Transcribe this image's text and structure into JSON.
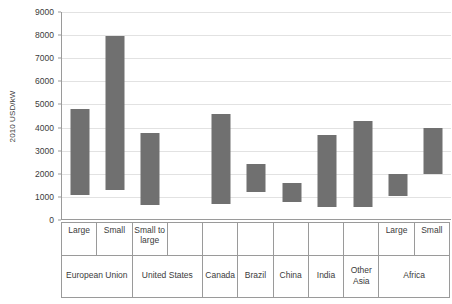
{
  "chart_data": {
    "type": "bar",
    "title": "",
    "subtitle": "",
    "xlabel": "",
    "ylabel": "2010 USD/kW",
    "ylim": [
      0,
      9000
    ],
    "ytick_step": 1000,
    "yticks": [
      0,
      1000,
      2000,
      3000,
      4000,
      5000,
      6000,
      7000,
      8000,
      9000
    ],
    "ytick_labels": [
      "0",
      "1000",
      "2000",
      "3000",
      "4000",
      "5000",
      "6000",
      "7000",
      "8000",
      "9000"
    ],
    "grid": true,
    "legend": "none",
    "bar_style": "floating-range",
    "bar_color": "#707070",
    "gridline_color": "#e2e2e2",
    "axis_color": "#9a9a9a",
    "categories": [
      "European Union - Large",
      "European Union - Small",
      "United States - Small to large",
      "Canada",
      "Brazil",
      "China",
      "India",
      "Other Asia",
      "Africa - Large",
      "Africa - Small"
    ],
    "series": [
      {
        "name": "Installed cost range",
        "low": [
          1100,
          1300,
          650,
          700,
          1220,
          800,
          570,
          580,
          1020,
          2000
        ],
        "high": [
          4800,
          7950,
          3750,
          4580,
          2420,
          1580,
          3680,
          4300,
          2000,
          4000
        ]
      }
    ],
    "bars": [
      {
        "group": "European Union",
        "sub": "Large",
        "low": 1100,
        "high": 4800
      },
      {
        "group": "European Union",
        "sub": "Small",
        "low": 1300,
        "high": 7950
      },
      {
        "group": "United States",
        "sub": "Small to large",
        "low": 650,
        "high": 3750
      },
      {
        "group": "United States",
        "sub": "",
        "low": null,
        "high": null
      },
      {
        "group": "Canada",
        "sub": "",
        "low": 700,
        "high": 4580
      },
      {
        "group": "Brazil",
        "sub": "",
        "low": 1220,
        "high": 2420
      },
      {
        "group": "China",
        "sub": "",
        "low": 800,
        "high": 1580
      },
      {
        "group": "India",
        "sub": "",
        "low": 570,
        "high": 3680
      },
      {
        "group": "Other Asia",
        "sub": "",
        "low": 580,
        "high": 4300
      },
      {
        "group": "Africa",
        "sub": "Large",
        "low": 1020,
        "high": 2000
      },
      {
        "group": "Africa",
        "sub": "Small",
        "low": 2000,
        "high": 4000
      }
    ]
  },
  "axis": {
    "sub_labels": [
      {
        "text": "Large",
        "span": 1
      },
      {
        "text": "Small",
        "span": 1
      },
      {
        "text": "Small to large",
        "span": 1
      },
      {
        "text": "",
        "span": 1
      },
      {
        "text": "",
        "span": 1
      },
      {
        "text": "",
        "span": 1
      },
      {
        "text": "",
        "span": 1
      },
      {
        "text": "",
        "span": 1
      },
      {
        "text": "",
        "span": 1
      },
      {
        "text": "Large",
        "span": 1
      },
      {
        "text": "Small",
        "span": 1
      }
    ],
    "group_labels": [
      {
        "text": "European Union",
        "span": 2
      },
      {
        "text": "United States",
        "span": 2
      },
      {
        "text": "Canada",
        "span": 1
      },
      {
        "text": "Brazil",
        "span": 1
      },
      {
        "text": "China",
        "span": 1
      },
      {
        "text": "India",
        "span": 1
      },
      {
        "text": "Other Asia",
        "span": 1
      },
      {
        "text": "Africa",
        "span": 2
      }
    ]
  }
}
